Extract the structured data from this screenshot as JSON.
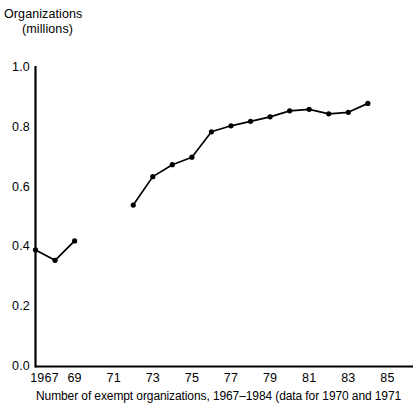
{
  "chart_data": {
    "type": "line",
    "title": "Organizations (millions)",
    "title_line1": "Organizations",
    "title_line2": "(millions)",
    "xlabel": "",
    "ylabel": "Organizations (millions)",
    "xlim": [
      1967,
      1985
    ],
    "ylim": [
      0.0,
      1.0
    ],
    "grid": false,
    "legend": null,
    "marker": "filled-circle",
    "line_color": "#000000",
    "ytick_labels": [
      "0.0",
      "0.2",
      "0.4",
      "0.6",
      "0.8",
      "1.0"
    ],
    "ytick_values": [
      0.0,
      0.2,
      0.4,
      0.6,
      0.8,
      1.0
    ],
    "xtick_labels": [
      "1967",
      "69",
      "71",
      "73",
      "75",
      "77",
      "79",
      "81",
      "83",
      "85"
    ],
    "xtick_values": [
      1967,
      1969,
      1971,
      1973,
      1975,
      1977,
      1979,
      1981,
      1983,
      1985
    ],
    "series": [
      {
        "name": "Organizations",
        "note": "gap in data for 1970 and 1971",
        "x": [
          1967,
          1968,
          1969,
          1972,
          1973,
          1974,
          1975,
          1976,
          1977,
          1978,
          1979,
          1980,
          1981,
          1982,
          1983,
          1984
        ],
        "values": [
          0.39,
          0.355,
          0.42,
          0.54,
          0.635,
          0.675,
          0.7,
          0.785,
          0.805,
          0.82,
          0.835,
          0.855,
          0.86,
          0.845,
          0.85,
          0.88
        ]
      }
    ],
    "segments": [
      {
        "x": [
          1967,
          1968,
          1969
        ],
        "values": [
          0.39,
          0.355,
          0.42
        ]
      },
      {
        "x": [
          1972,
          1973,
          1974,
          1975,
          1976,
          1977,
          1978,
          1979,
          1980,
          1981,
          1982,
          1983,
          1984
        ],
        "values": [
          0.54,
          0.635,
          0.675,
          0.7,
          0.785,
          0.805,
          0.82,
          0.835,
          0.855,
          0.86,
          0.845,
          0.85,
          0.88
        ]
      }
    ],
    "annotations": []
  },
  "caption": {
    "text": "Number of exempt organizations, 1967–1984 (data for 1970 and 1971"
  }
}
